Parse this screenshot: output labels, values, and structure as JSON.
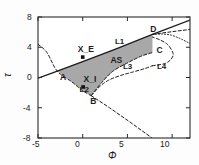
{
  "figure": {
    "background": "#fdfdfd",
    "frame_color": "#2a2a2a",
    "shade_color": "#a8a8a8"
  },
  "chart_data": {
    "type": "line",
    "title": "",
    "subtitle": "",
    "xlabel": "Φ",
    "ylabel": "τ",
    "xlim": [
      -5,
      12
    ],
    "ylim": [
      -8,
      8
    ],
    "xticks": [
      -5,
      0,
      5,
      10
    ],
    "xtick_labels": [
      "-5",
      "0",
      "5",
      "10"
    ],
    "yticks": [
      -8,
      -4,
      0,
      4,
      8
    ],
    "ytick_labels": [
      "-8",
      "-4",
      "0",
      "4",
      "8"
    ],
    "grid": false,
    "legend": "none",
    "annotations": [
      {
        "text": "L1",
        "x": 3.6,
        "y": 4.55,
        "kind": "curve-label"
      },
      {
        "text": "L2",
        "x": -0.35,
        "y": -1.75,
        "kind": "curve-label"
      },
      {
        "text": "L3",
        "x": 4.5,
        "y": 1.25,
        "kind": "curve-label"
      },
      {
        "text": "L4",
        "x": 8.3,
        "y": 1.3,
        "kind": "curve-label"
      },
      {
        "text": "AS",
        "x": 3.1,
        "y": 2.2,
        "kind": "state-label"
      },
      {
        "text": "A",
        "x": -2.55,
        "y": 0.0,
        "kind": "point-label"
      },
      {
        "text": "B",
        "x": 0.85,
        "y": -3.2,
        "kind": "point-label"
      },
      {
        "text": "C",
        "x": 8.25,
        "y": 3.45,
        "kind": "point-label"
      },
      {
        "text": "D",
        "x": 7.55,
        "y": 6.35,
        "kind": "point-label"
      },
      {
        "text": "X_E",
        "x": -0.55,
        "y": 3.6,
        "kind": "marker-label"
      },
      {
        "text": "X_I",
        "x": 0.1,
        "y": -0.35,
        "kind": "marker-label"
      }
    ],
    "markers": [
      {
        "name": "X_E",
        "x": 0.0,
        "y": 2.7
      },
      {
        "name": "X_I",
        "x": 0.05,
        "y": -1.25
      }
    ],
    "critical_points": [
      {
        "name": "A",
        "x": -2.85,
        "y": 0.85
      },
      {
        "name": "B",
        "x": 0.95,
        "y": -2.4
      },
      {
        "name": "C",
        "x": 7.8,
        "y": 3.3
      },
      {
        "name": "D",
        "x": 7.8,
        "y": 5.7
      }
    ],
    "series": [
      {
        "name": "L1",
        "style": "solid",
        "color": "#1c1c1c",
        "points": [
          [
            -5,
            -0.1
          ],
          [
            -2.85,
            0.85
          ],
          [
            0,
            2.1
          ],
          [
            3.6,
            3.72
          ],
          [
            7.8,
            5.7
          ],
          [
            12,
            7.6
          ]
        ]
      },
      {
        "name": "L2",
        "style": "dashed",
        "color": "#1c1c1c",
        "points": [
          [
            -5,
            4.4
          ],
          [
            -4,
            3.3
          ],
          [
            -2.85,
            0.85
          ],
          [
            -1.2,
            -0.6
          ],
          [
            0.0,
            -1.75
          ],
          [
            0.95,
            -2.4
          ]
        ]
      },
      {
        "name": "L3",
        "style": "dashed",
        "color": "#1c1c1c",
        "points": [
          [
            0.95,
            -2.4
          ],
          [
            1.9,
            -1.2
          ],
          [
            2.9,
            -0.35
          ],
          [
            4.2,
            0.25
          ],
          [
            5.6,
            0.72
          ],
          [
            7.0,
            1.2
          ],
          [
            7.8,
            1.55
          ]
        ]
      },
      {
        "name": "L4",
        "style": "dashed",
        "color": "#1c1c1c",
        "points": [
          [
            7.8,
            1.55
          ],
          [
            9.2,
            1.85
          ],
          [
            9.9,
            2.45
          ],
          [
            10.1,
            3.2
          ],
          [
            9.5,
            4.35
          ],
          [
            8.6,
            5.0
          ],
          [
            7.8,
            5.35
          ]
        ]
      },
      {
        "name": "L3-upper",
        "style": "dashed",
        "color": "#1c1c1c",
        "points": [
          [
            0.95,
            -2.4
          ],
          [
            2.1,
            -0.7
          ],
          [
            3.4,
            0.85
          ],
          [
            5.2,
            2.05
          ],
          [
            6.6,
            2.85
          ],
          [
            7.8,
            3.3
          ]
        ]
      },
      {
        "name": "B-tail",
        "style": "dashed",
        "color": "#1c1c1c",
        "points": [
          [
            0.95,
            -2.4
          ],
          [
            3.0,
            -4.0
          ],
          [
            5.3,
            -5.9
          ],
          [
            7.7,
            -7.95
          ]
        ]
      },
      {
        "name": "dotted-branch",
        "style": "dotted",
        "color": "#1c1c1c",
        "points": [
          [
            7.8,
            5.7
          ],
          [
            8.9,
            5.75
          ],
          [
            9.9,
            5.6
          ],
          [
            10.8,
            5.2
          ],
          [
            11.5,
            4.8
          ],
          [
            12,
            4.5
          ]
        ]
      },
      {
        "name": "dashed-top-right",
        "style": "dashed",
        "color": "#1c1c1c",
        "points": [
          [
            7.8,
            5.7
          ],
          [
            9.3,
            5.95
          ],
          [
            10.6,
            6.15
          ],
          [
            12,
            6.35
          ]
        ]
      }
    ],
    "shaded_region": {
      "name": "AS",
      "fill": "#a8a8a8",
      "boundary": [
        [
          -2.85,
          0.85
        ],
        [
          0,
          2.1
        ],
        [
          3.6,
          3.72
        ],
        [
          7.8,
          5.7
        ],
        [
          7.8,
          3.3
        ],
        [
          6.6,
          2.85
        ],
        [
          5.2,
          2.05
        ],
        [
          3.4,
          0.85
        ],
        [
          2.1,
          -0.7
        ],
        [
          0.95,
          -2.4
        ],
        [
          0.0,
          -1.75
        ],
        [
          -1.2,
          -0.6
        ]
      ]
    }
  }
}
